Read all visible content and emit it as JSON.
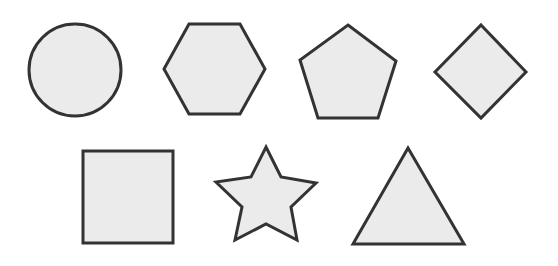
{
  "figure": {
    "fill_color": "#ebebeb",
    "stroke_color": "#333333",
    "stroke_width": 3
  },
  "shapes": [
    {
      "name": "circle",
      "row": 1,
      "cx": 75,
      "cy": 70,
      "r": 46
    },
    {
      "name": "hexagon",
      "row": 1,
      "points": "164,69 189,24 240,24 265,69 240,114 189,114"
    },
    {
      "name": "pentagon",
      "row": 1,
      "points": "348,25 396,61 378,118 318,118 300,60"
    },
    {
      "name": "diamond",
      "row": 1,
      "points": "481,25 526,72 481,118 435,72"
    },
    {
      "name": "square",
      "row": 2,
      "x": 83,
      "y": 151,
      "width": 90,
      "height": 92
    },
    {
      "name": "star",
      "row": 2,
      "points": "266,147 281,177 316,183 291,207 297,240 266,224 235,240 242,207 216,182 251,177"
    },
    {
      "name": "triangle",
      "row": 2,
      "points": "408,148 464,244 353,244"
    }
  ]
}
